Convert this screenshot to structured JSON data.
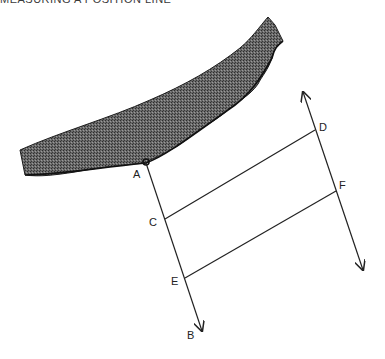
{
  "header": {
    "title": "MEASURING A POSITION LINE"
  },
  "diagram": {
    "labels": {
      "A": "A",
      "B": "B",
      "C": "C",
      "D": "D",
      "E": "E",
      "F": "F"
    },
    "colors": {
      "land": "#555555",
      "line": "#222222",
      "background": "#ffffff"
    },
    "points": {
      "A": [
        146,
        163
      ],
      "B_arrow": [
        202,
        331
      ],
      "C": [
        165,
        219
      ],
      "D": [
        315,
        130
      ],
      "E": [
        185,
        278
      ],
      "F": [
        336,
        191
      ],
      "top_arrow": [
        303,
        92
      ],
      "bottom_arrow": [
        363,
        270
      ]
    }
  }
}
